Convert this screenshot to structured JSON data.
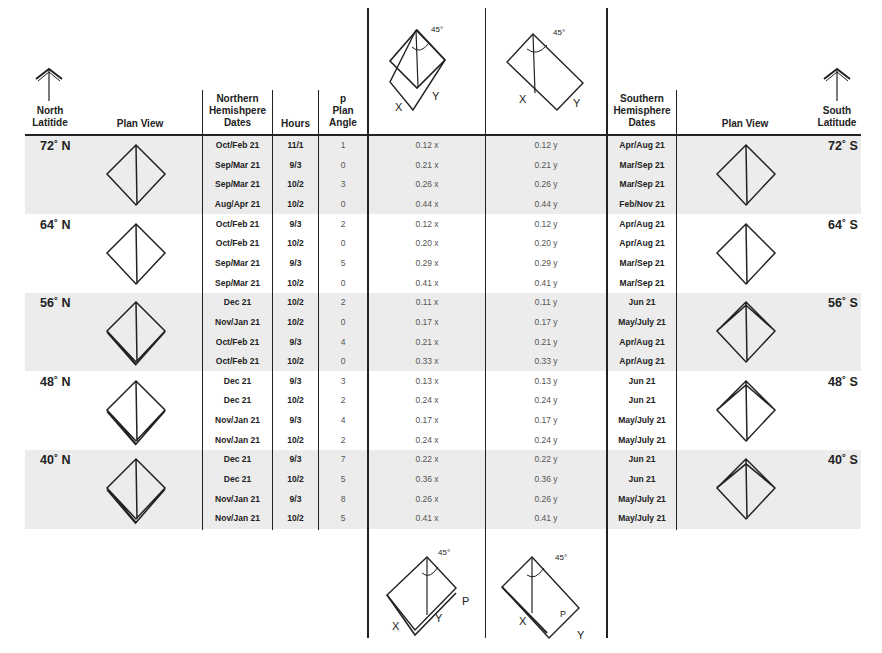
{
  "header": {
    "north_latitude": [
      "North",
      "Latitide"
    ],
    "plan_view_left": "Plan View",
    "northern_dates": [
      "Northern",
      "Hemishpere",
      "Dates"
    ],
    "hours": "Hours",
    "plan_angle": [
      "p",
      "Plan",
      "Angle"
    ],
    "southern_dates": [
      "Southern",
      "Hemisphere",
      "Dates"
    ],
    "plan_view_right": "Plan View",
    "south_latitude": [
      "South",
      "Latitude"
    ]
  },
  "diagrams": {
    "top_left": {
      "angle_label": "45°",
      "labels": [
        "X",
        "Y"
      ]
    },
    "top_right": {
      "angle_label": "45°",
      "labels": [
        "X",
        "Y"
      ]
    },
    "bottom_left": {
      "angle_label": "45°",
      "labels": [
        "X",
        "Y",
        "P"
      ]
    },
    "bottom_right": {
      "angle_label": "45°",
      "labels": [
        "X",
        "Y",
        "P"
      ]
    }
  },
  "groups": [
    {
      "north_lat": "72˚ N",
      "south_lat": "72˚ S",
      "shaded": true,
      "rows": [
        {
          "n_date": "Oct/Feb 21",
          "hours": "11/1",
          "angle": "1",
          "x": "0.12 x",
          "y": "0.12 y",
          "s_date": "Apr/Aug 21"
        },
        {
          "n_date": "Sep/Mar 21",
          "hours": "9/3",
          "angle": "0",
          "x": "0.21 x",
          "y": "0.21 y",
          "s_date": "Mar/Sep 21"
        },
        {
          "n_date": "Sep/Mar 21",
          "hours": "10/2",
          "angle": "3",
          "x": "0.26 x",
          "y": "0.26 y",
          "s_date": "Mar/Sep 21"
        },
        {
          "n_date": "Aug/Apr 21",
          "hours": "10/2",
          "angle": "0",
          "x": "0.44 x",
          "y": "0.44 y",
          "s_date": "Feb/Nov 21"
        }
      ]
    },
    {
      "north_lat": "64˚ N",
      "south_lat": "64˚ S",
      "shaded": false,
      "rows": [
        {
          "n_date": "Oct/Feb 21",
          "hours": "9/3",
          "angle": "2",
          "x": "0.12 x",
          "y": "0.12 y",
          "s_date": "Apr/Aug 21"
        },
        {
          "n_date": "Oct/Feb 21",
          "hours": "10/2",
          "angle": "0",
          "x": "0.20 x",
          "y": "0.20 y",
          "s_date": "Apr/Aug 21"
        },
        {
          "n_date": "Sep/Mar 21",
          "hours": "9/3",
          "angle": "5",
          "x": "0.29 x",
          "y": "0.29 y",
          "s_date": "Mar/Sep 21"
        },
        {
          "n_date": "Sep/Mar 21",
          "hours": "10/2",
          "angle": "0",
          "x": "0.41 x",
          "y": "0.41 y",
          "s_date": "Mar/Sep 21"
        }
      ]
    },
    {
      "north_lat": "56˚ N",
      "south_lat": "56˚ S",
      "shaded": true,
      "rows": [
        {
          "n_date": "Dec 21",
          "hours": "10/2",
          "angle": "2",
          "x": "0.11 x",
          "y": "0.11 y",
          "s_date": "Jun 21"
        },
        {
          "n_date": "Nov/Jan 21",
          "hours": "10/2",
          "angle": "0",
          "x": "0.17 x",
          "y": "0.17 y",
          "s_date": "May/July 21"
        },
        {
          "n_date": "Oct/Feb 21",
          "hours": "9/3",
          "angle": "4",
          "x": "0.21 x",
          "y": "0.21 y",
          "s_date": "Apr/Aug 21"
        },
        {
          "n_date": "Oct/Feb 21",
          "hours": "10/2",
          "angle": "0",
          "x": "0.33 x",
          "y": "0.33 y",
          "s_date": "Apr/Aug 21"
        }
      ]
    },
    {
      "north_lat": "48˚ N",
      "south_lat": "48˚ S",
      "shaded": false,
      "rows": [
        {
          "n_date": "Dec 21",
          "hours": "9/3",
          "angle": "3",
          "x": "0.13 x",
          "y": "0.13 y",
          "s_date": "Jun 21"
        },
        {
          "n_date": "Dec 21",
          "hours": "10/2",
          "angle": "2",
          "x": "0.24 x",
          "y": "0.24 y",
          "s_date": "Jun 21"
        },
        {
          "n_date": "Nov/Jan 21",
          "hours": "9/3",
          "angle": "4",
          "x": "0.17 x",
          "y": "0.17 y",
          "s_date": "May/July 21"
        },
        {
          "n_date": "Nov/Jan 21",
          "hours": "10/2",
          "angle": "2",
          "x": "0.24 x",
          "y": "0.24 y",
          "s_date": "May/July 21"
        }
      ]
    },
    {
      "north_lat": "40˚ N",
      "south_lat": "40˚ S",
      "shaded": true,
      "rows": [
        {
          "n_date": "Dec 21",
          "hours": "9/3",
          "angle": "7",
          "x": "0.22 x",
          "y": "0.22 y",
          "s_date": "Jun 21"
        },
        {
          "n_date": "Dec 21",
          "hours": "10/2",
          "angle": "5",
          "x": "0.36 x",
          "y": "0.36 y",
          "s_date": "Jun 21"
        },
        {
          "n_date": "Nov/Jan 21",
          "hours": "9/3",
          "angle": "8",
          "x": "0.26 x",
          "y": "0.26 y",
          "s_date": "May/July 21"
        },
        {
          "n_date": "Nov/Jan 21",
          "hours": "10/2",
          "angle": "5",
          "x": "0.41 x",
          "y": "0.41 y",
          "s_date": "May/July 21"
        }
      ]
    }
  ]
}
